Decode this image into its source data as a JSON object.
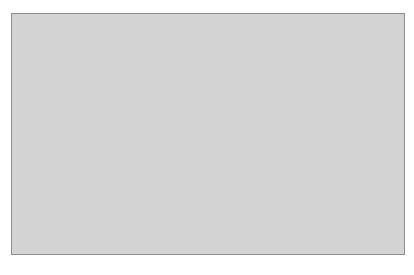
{
  "chart_data": [
    {
      "type": "line",
      "title": "",
      "ylabel": "BP, mm Hg",
      "ylim": [
        50,
        130
      ],
      "yticks": [
        50,
        70,
        90,
        110,
        130
      ],
      "categories": [
        "<40",
        "41-60",
        ">60"
      ],
      "panels": [
        {
          "title": "Island",
          "series": [
            {
              "name": "Systolic",
              "values": [
                108,
                103,
                106
              ]
            },
            {
              "name": "Diastolic",
              "values": [
                65,
                62,
                63
              ]
            }
          ]
        },
        {
          "title": "Kuna Nega",
          "series": [
            {
              "name": "Systolic",
              "values": [
                103,
                109,
                124
              ]
            },
            {
              "name": "Diastolic",
              "values": [
                69,
                69,
                73
              ]
            }
          ]
        },
        {
          "title": "Panama City",
          "series": [
            {
              "name": "Systolic",
              "values": [
                102,
                111,
                127
              ]
            },
            {
              "name": "Diastolic",
              "values": [
                69,
                72,
                78
              ]
            }
          ]
        }
      ],
      "error_bars": true,
      "grid": false
    },
    {
      "type": "bar",
      "ylabel": "Hypertensive, %",
      "xlabel": "Years",
      "ylim": [
        0,
        50
      ],
      "yticks": [
        0,
        10,
        20,
        30,
        40,
        50
      ],
      "categories": [
        "<40",
        "41-60",
        ">60"
      ],
      "panels": [
        {
          "title": "Island",
          "values": [
            2.5,
            1.5,
            0.8
          ]
        },
        {
          "title": "Kuna Nega",
          "values": [
            6,
            3.5,
            35
          ]
        },
        {
          "title": "Panama City",
          "values": [
            4,
            10,
            44
          ]
        }
      ],
      "grid": false
    }
  ],
  "labels": {
    "panel_titles": [
      "Island",
      "Kuna Nega",
      "Panama City"
    ],
    "bp_axis_label_main": "BP, ",
    "bp_axis_label_unit": "mm Hg",
    "hyp_axis_label": "Hypertensive, %",
    "x_axis_label": "Years",
    "bp_ticks": [
      "130",
      "110",
      "90",
      "70",
      "50"
    ],
    "hyp_ticks": [
      "50",
      "40",
      "30",
      "20",
      "10",
      "0"
    ],
    "categories": [
      "<40",
      "41–60",
      ">60"
    ]
  },
  "colors": {
    "frame_bg": "#d3d3d3",
    "panel_bg": "#ffffff",
    "bar": "#2b2b2b",
    "marker": "#111111",
    "text": "#3a3a3a"
  }
}
